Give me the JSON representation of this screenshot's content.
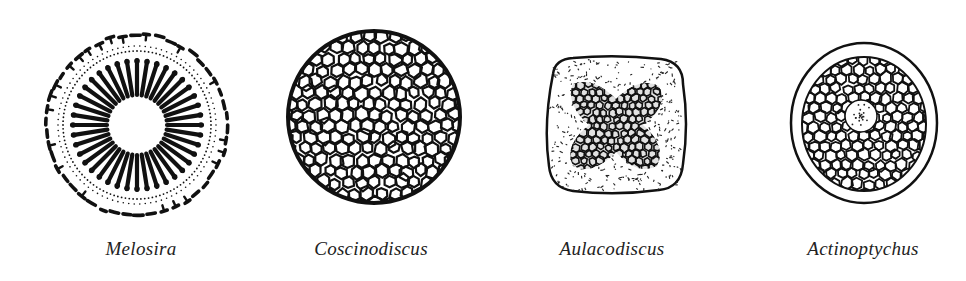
{
  "diatoms": [
    {
      "name": "Melosira",
      "shape": "radial-striae-disc",
      "center_x": 137,
      "label_center_x": 141
    },
    {
      "name": "Coscinodiscus",
      "shape": "reticulate-disc",
      "center_x": 374,
      "label_center_x": 371
    },
    {
      "name": "Aulacodiscus",
      "shape": "rounded-square-with-cross",
      "center_x": 615,
      "label_center_x": 612
    },
    {
      "name": "Actinoptychus",
      "shape": "ringed-reticulate-disc",
      "center_x": 863,
      "label_center_x": 863
    }
  ],
  "colors": {
    "ink": "#111111",
    "label": "#222222",
    "background": "#ffffff"
  }
}
